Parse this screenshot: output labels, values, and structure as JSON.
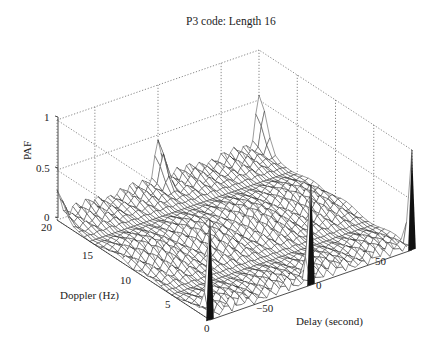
{
  "chart_data": {
    "type": "surface3d",
    "title": "P3 code: Length 16",
    "xlabel": "Delay (second)",
    "ylabel": "Doppler (Hz)",
    "zlabel": "PAF",
    "x_ticks": [
      "-50",
      "0",
      "50"
    ],
    "y_ticks": [
      "0",
      "5",
      "10",
      "15",
      "20"
    ],
    "z_ticks": [
      "0",
      "0.5",
      "1"
    ],
    "xlim": [
      -80,
      80
    ],
    "ylim": [
      0,
      20
    ],
    "zlim": [
      0,
      1
    ],
    "grid": true,
    "peaks": [
      {
        "delay": -80,
        "doppler": 0,
        "paf": 1.0
      },
      {
        "delay": 0,
        "doppler": 0,
        "paf": 1.0
      },
      {
        "delay": 80,
        "doppler": 0,
        "paf": 1.0
      },
      {
        "delay": -80,
        "doppler": 20,
        "paf": 0.3
      },
      {
        "delay": 0,
        "doppler": 20,
        "paf": 0.45
      },
      {
        "delay": 80,
        "doppler": 20,
        "paf": 0.55
      }
    ],
    "sidelobe_level_approx": 0.12
  },
  "labels": {
    "title": "P3 code: Length 16",
    "zlabel": "PAF",
    "ylabel": "Doppler (Hz)",
    "xlabel": "Delay (second)",
    "z0": "0",
    "z05": "0.5",
    "z1": "1",
    "y0": "0",
    "y5": "5",
    "y10": "10",
    "y15": "15",
    "y20": "20",
    "xm50": "−50",
    "x0": "0",
    "x50": "50"
  }
}
